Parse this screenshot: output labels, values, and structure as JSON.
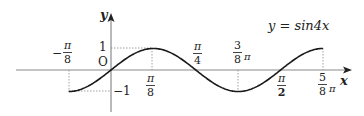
{
  "figure": {
    "equation_label": "y = sin4x",
    "axis_x_label": "x",
    "axis_y_label": "y",
    "origin_label": "O",
    "y_tick_top": "1",
    "y_tick_bottom": "−1",
    "x_labels": [
      {
        "id": "neg_pi_8",
        "sign": "−",
        "num": "π",
        "den": "8",
        "suffix": ""
      },
      {
        "id": "pi_8",
        "sign": "",
        "num": "π",
        "den": "8",
        "suffix": ""
      },
      {
        "id": "pi_4",
        "sign": "",
        "num": "π",
        "den": "4",
        "suffix": ""
      },
      {
        "id": "3_8_pi",
        "sign": "",
        "num": "3",
        "den": "8",
        "suffix": "π"
      },
      {
        "id": "pi_2",
        "sign": "",
        "num": "π",
        "den": "2",
        "suffix": ""
      },
      {
        "id": "5_8_pi",
        "sign": "",
        "num": "5",
        "den": "8",
        "suffix": "π"
      }
    ],
    "colors": {
      "curve": "#1a1a1a",
      "axis": "#8a8a8a",
      "dashed": "#888888",
      "text": "#222222"
    }
  },
  "chart_data": {
    "type": "line",
    "title": "y = sin4x",
    "xlabel": "x",
    "ylabel": "y",
    "x_domain": [
      "-π/8",
      "5π/8"
    ],
    "xlim_radians": [
      -0.3927,
      1.9635
    ],
    "ylim": [
      -1,
      1
    ],
    "x_ticks": [
      "-π/8",
      "π/8",
      "π/4",
      "3π/8",
      "π/2",
      "5π/8"
    ],
    "y_ticks": [
      -1,
      1
    ],
    "key_points": [
      {
        "x": "-π/8",
        "y": -1
      },
      {
        "x": "0",
        "y": 0
      },
      {
        "x": "π/8",
        "y": 1
      },
      {
        "x": "π/4",
        "y": 0
      },
      {
        "x": "3π/8",
        "y": -1
      },
      {
        "x": "π/2",
        "y": 0
      },
      {
        "x": "5π/8",
        "y": 1
      }
    ],
    "grid": false,
    "legend": "none"
  }
}
